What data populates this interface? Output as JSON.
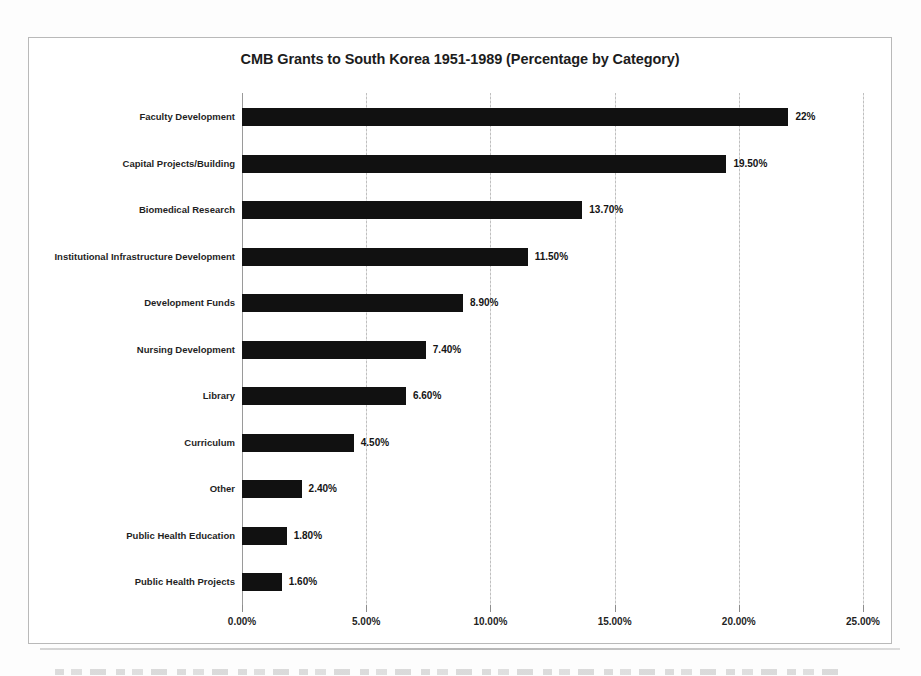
{
  "chart_data": {
    "type": "bar",
    "orientation": "horizontal",
    "title": "CMB Grants to South Korea 1951-1989 (Percentage by Category)",
    "xlabel": "",
    "ylabel": "",
    "xlim": [
      0,
      25
    ],
    "grid": true,
    "legend": null,
    "categories": [
      "Faculty Development",
      "Capital Projects/Building",
      "Biomedical Research",
      "Institutional Infrastructure Development",
      "Development Funds",
      "Nursing Development",
      "Library",
      "Curriculum",
      "Other",
      "Public Health Education",
      "Public Health Projects"
    ],
    "values": [
      22,
      19.5,
      13.7,
      11.5,
      8.9,
      7.4,
      6.6,
      4.5,
      2.4,
      1.8,
      1.6
    ],
    "value_labels": [
      "22%",
      "19.50%",
      "13.70%",
      "11.50%",
      "8.90%",
      "7.40%",
      "6.60%",
      "4.50%",
      "2.40%",
      "1.80%",
      "1.60%"
    ],
    "xticks": [
      0,
      5,
      10,
      15,
      20,
      25
    ],
    "xtick_labels": [
      "0.00%",
      "5.00%",
      "10.00%",
      "15.00%",
      "20.00%",
      "25.00%"
    ],
    "bar_color": "#111111",
    "gridline_color": "#c7c7c7",
    "text_color": "#1f1f1f"
  }
}
